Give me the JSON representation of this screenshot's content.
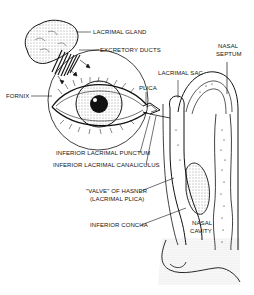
{
  "diagram": {
    "labels": {
      "lacrimal_gland": "LACRIMAL GLAND",
      "excretory_ducts": "EXCRETORY DUCTS",
      "nasal_septum_1": "NASAL",
      "nasal_septum_2": "SEPTUM",
      "lacrimal_sac": "LACRIMAL SAC",
      "fornix": "FORNIX",
      "plica": "PLICA",
      "inferior_lacrimal_punctum": "INFERIOR LACRIMAL PUNCTUM",
      "inferior_lacrimal_canaliculus": "INFERIOR LACRIMAL CANALICULUS",
      "valve_of_hasner_1": "\"VALVE\" OF HASNER",
      "valve_of_hasner_2": "(LACRIMAL PLICA)",
      "inferior_concha": "INFERIOR CONCHA",
      "nasal_cavity_1": "NASAL",
      "nasal_cavity_2": "CAVITY"
    }
  }
}
